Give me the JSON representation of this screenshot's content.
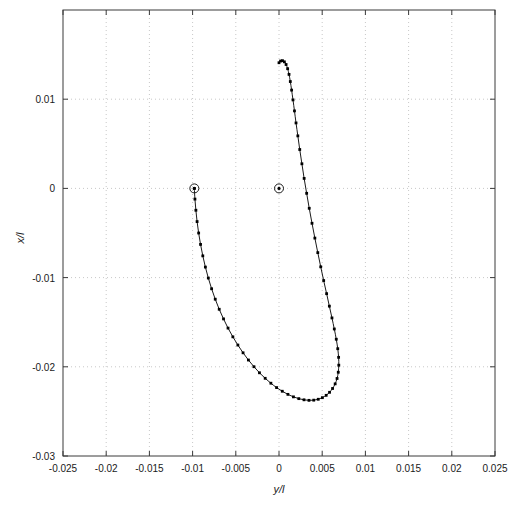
{
  "chart_data": {
    "type": "line",
    "title": "",
    "xlabel": "y/l",
    "ylabel": "x/l",
    "xlim": [
      -0.025,
      0.025
    ],
    "ylim": [
      -0.03,
      0.02
    ],
    "grid": true,
    "legend": null,
    "xticks": [
      -0.025,
      -0.02,
      -0.015,
      -0.01,
      -0.005,
      0,
      0.005,
      0.01,
      0.015,
      0.02,
      0.025
    ],
    "xticklabels": [
      "-0.025",
      "-0.02",
      "-0.015",
      "-0.01",
      "-0.005",
      "0",
      "0.005",
      "0.01",
      "0.015",
      "0.02",
      "0.025"
    ],
    "yticks": [
      0.01,
      0,
      -0.01,
      -0.02,
      -0.03
    ],
    "yticklabels": [
      "0.01",
      "0",
      "-0.01",
      "-0.02",
      "-0.03"
    ],
    "series": [
      {
        "name": "trajectory",
        "marker": "square-dot",
        "line_color": "#1a1a1a",
        "marker_color": "#000000",
        "x": [
          -0.0098,
          -0.00973,
          -0.00962,
          -0.00948,
          -0.0093,
          -0.00908,
          -0.00882,
          -0.00852,
          -0.00818,
          -0.0078,
          -0.00738,
          -0.00692,
          -0.00642,
          -0.0059,
          -0.00534,
          -0.00476,
          -0.00416,
          -0.00354,
          -0.0029,
          -0.00226,
          -0.0016,
          -0.00094,
          -0.00028,
          0.00038,
          0.00103,
          0.00167,
          0.00229,
          0.00289,
          0.00347,
          0.00402,
          0.00454,
          0.00502,
          0.00546,
          0.00585,
          0.0062,
          0.0065,
          0.00672,
          0.00686,
          0.00692,
          0.0069,
          0.0068,
          0.00663,
          0.0064,
          0.00613,
          0.00583,
          0.00551,
          0.00517,
          0.00483,
          0.00449,
          0.00415,
          0.00382,
          0.0035,
          0.0032,
          0.00291,
          0.00265,
          0.0024,
          0.00218,
          0.00197,
          0.00179,
          0.00162,
          0.00146,
          0.00131,
          0.00116,
          0.001,
          0.00082,
          0.00062,
          0.0004,
          0.00018,
          0.0
        ],
        "y": [
          0.0,
          -0.0012,
          -0.00245,
          -0.00372,
          -0.005,
          -0.00628,
          -0.00756,
          -0.00882,
          -0.01005,
          -0.01125,
          -0.01242,
          -0.01355,
          -0.01463,
          -0.01566,
          -0.01664,
          -0.01756,
          -0.01843,
          -0.01924,
          -0.01999,
          -0.02067,
          -0.02129,
          -0.02184,
          -0.02233,
          -0.02274,
          -0.02309,
          -0.02337,
          -0.02357,
          -0.0237,
          -0.02376,
          -0.02374,
          -0.02364,
          -0.02346,
          -0.0232,
          -0.02286,
          -0.02243,
          -0.02191,
          -0.02131,
          -0.02061,
          -0.01982,
          -0.01894,
          -0.01797,
          -0.01691,
          -0.01576,
          -0.01452,
          -0.0132,
          -0.0118,
          -0.01033,
          -0.00879,
          -0.0072,
          -0.00557,
          -0.00391,
          -0.00223,
          -0.00055,
          0.00112,
          0.00276,
          0.00436,
          0.00589,
          0.00734,
          0.00869,
          0.00992,
          0.01102,
          0.01198,
          0.01278,
          0.01342,
          0.01389,
          0.01419,
          0.01432,
          0.01428,
          0.01409
        ]
      }
    ],
    "endpoint_markers": [
      {
        "name": "start-point",
        "x": -0.0098,
        "y": 0.0,
        "style": "circle-with-dot"
      },
      {
        "name": "end-point",
        "x": 0.0,
        "y": 0.0,
        "style": "circle-with-dot"
      }
    ]
  },
  "colors": {
    "axis": "#3a3a3a",
    "grid": "#c8c8c8",
    "curve": "#1a1a1a",
    "marker": "#000000",
    "background": "#ffffff",
    "text": "#1a1a1a"
  }
}
